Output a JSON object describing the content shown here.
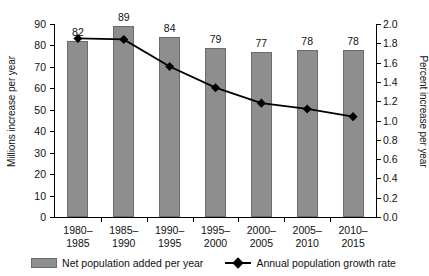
{
  "chart_data": {
    "type": "bar",
    "title": "",
    "categories": [
      "1980–\n1985",
      "1985–\n1990",
      "1990–\n1995",
      "1995–\n2000",
      "2000–\n2005",
      "2005–\n2010",
      "2010–\n2015"
    ],
    "category_lines": [
      [
        "1980–",
        "1985"
      ],
      [
        "1985–",
        "1990"
      ],
      [
        "1990–",
        "1995"
      ],
      [
        "1995–",
        "2000"
      ],
      [
        "2000–",
        "2005"
      ],
      [
        "2005–",
        "2010"
      ],
      [
        "2010–",
        "2015"
      ]
    ],
    "series": [
      {
        "name": "Net population added per year",
        "render": "bar",
        "axis": "left",
        "values": [
          82,
          89,
          84,
          79,
          77,
          78,
          78
        ],
        "labels": [
          "82",
          "89",
          "84",
          "79",
          "77",
          "78",
          "78"
        ],
        "color": "#8e8e8e"
      },
      {
        "name": "Annual population growth rate",
        "render": "line",
        "axis": "right",
        "values": [
          1.85,
          1.84,
          1.56,
          1.34,
          1.18,
          1.12,
          1.04
        ],
        "color": "#000000"
      }
    ],
    "xlabel": "",
    "ylabel": "Millions increase per year",
    "ylabel_right": "Percent increase per year",
    "ylim": [
      0,
      90
    ],
    "ylim_right": [
      0.0,
      2.0
    ],
    "yticks": [
      0,
      10,
      20,
      30,
      40,
      50,
      60,
      70,
      80,
      90
    ],
    "ytick_labels": [
      "0",
      "10",
      "20",
      "30",
      "40",
      "50",
      "60",
      "70",
      "80",
      "90"
    ],
    "yticks_right": [
      0.0,
      0.2,
      0.4,
      0.6,
      0.8,
      1.0,
      1.2,
      1.4,
      1.6,
      1.8,
      2.0
    ],
    "ytick_labels_right": [
      "0.0",
      "0.2",
      "0.4",
      "0.6",
      "0.8",
      "1.0",
      "1.2",
      "1.4",
      "1.6",
      "1.8",
      "2.0"
    ],
    "grid": false,
    "legend_position": "bottom"
  },
  "legend": {
    "bar_label": "Net population added per year",
    "line_label": "Annual population growth rate"
  }
}
